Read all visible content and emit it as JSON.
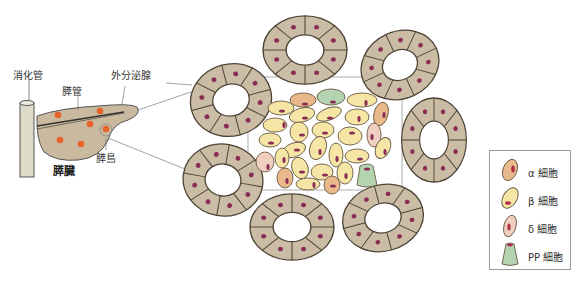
{
  "labels": {
    "digestive_tract": "消化管",
    "pancreatic_duct": "膵管",
    "exocrine_gland": "外分泌腺",
    "islet": "膵島",
    "pancreas": "膵臓"
  },
  "legend": {
    "items": [
      {
        "label": "α 細胞",
        "fill": "#e9b98c"
      },
      {
        "label": "β 細胞",
        "fill": "#f6e6a6"
      },
      {
        "label": "δ 細胞",
        "fill": "#f0cfc0"
      },
      {
        "label": "PP 細胞",
        "fill": "#b4d3b0"
      }
    ]
  },
  "colors": {
    "acinus_fill": "#cbbca5",
    "acinus_stroke": "#4e4436",
    "nucleus": "#8a2d55",
    "organ_fill": "#c9b99e",
    "islet_dot": "#e8632a",
    "tube_fill": "#dedbc8",
    "connector": "#8e9aa3"
  }
}
